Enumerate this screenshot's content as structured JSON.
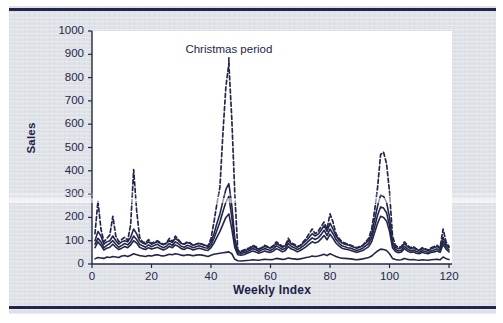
{
  "figure": {
    "background_color": "#dfe3e8",
    "plot_background_color": "#ffffff",
    "ink_color": "#23264b",
    "rule_color": "#22264a",
    "caption_top_text": "",
    "caption_bottom_text": ""
  },
  "chart_data": {
    "type": "line",
    "title": "",
    "subtitle": "",
    "xlabel": "Weekly Index",
    "ylabel": "Sales",
    "xlim": [
      0,
      121
    ],
    "ylim": [
      0,
      1000
    ],
    "xticks": [
      0,
      20,
      40,
      60,
      80,
      100,
      120
    ],
    "xtick_labels": [
      "0",
      "20",
      "40",
      "60",
      "80",
      "100",
      "120"
    ],
    "yticks": [
      0,
      100,
      200,
      300,
      400,
      500,
      600,
      700,
      800,
      900,
      1000
    ],
    "ytick_labels": [
      "0",
      "100",
      "200",
      "300",
      "400",
      "500",
      "600",
      "700",
      "800",
      "900",
      "1000"
    ],
    "grid": false,
    "legend_position": "none",
    "annotations": [
      {
        "text": "Christmas period",
        "x": 46,
        "y": 905,
        "pointer_to_x": 46,
        "pointer_to_y": 860
      }
    ],
    "series": [
      {
        "name": "Series A",
        "style": "dashed",
        "color": "#23264b",
        "x": [
          1,
          2,
          3,
          4,
          5,
          6,
          7,
          8,
          9,
          10,
          11,
          12,
          13,
          14,
          15,
          16,
          17,
          18,
          19,
          20,
          21,
          22,
          23,
          24,
          25,
          26,
          27,
          28,
          29,
          30,
          31,
          32,
          33,
          34,
          35,
          36,
          37,
          38,
          39,
          40,
          41,
          42,
          43,
          44,
          45,
          46,
          47,
          48,
          49,
          50,
          51,
          52,
          53,
          54,
          55,
          56,
          57,
          58,
          59,
          60,
          61,
          62,
          63,
          64,
          65,
          66,
          67,
          68,
          69,
          70,
          71,
          72,
          73,
          74,
          75,
          76,
          77,
          78,
          79,
          80,
          81,
          82,
          83,
          84,
          85,
          86,
          87,
          88,
          89,
          90,
          91,
          92,
          93,
          94,
          95,
          96,
          97,
          98,
          99,
          100,
          101,
          102,
          103,
          104,
          105,
          106,
          107,
          108,
          109,
          110,
          111,
          112,
          113,
          114,
          115,
          116,
          117,
          118,
          119,
          120
        ],
        "values": [
          130,
          270,
          150,
          95,
          110,
          125,
          205,
          120,
          95,
          105,
          115,
          100,
          170,
          405,
          230,
          115,
          95,
          90,
          105,
          88,
          95,
          100,
          92,
          85,
          90,
          110,
          95,
          120,
          105,
          90,
          85,
          95,
          90,
          80,
          85,
          90,
          85,
          80,
          75,
          110,
          180,
          260,
          330,
          560,
          760,
          860,
          620,
          300,
          60,
          55,
          60,
          65,
          70,
          80,
          75,
          65,
          70,
          80,
          75,
          70,
          80,
          95,
          85,
          75,
          80,
          110,
          90,
          85,
          75,
          80,
          95,
          110,
          130,
          150,
          130,
          140,
          160,
          180,
          150,
          215,
          180,
          130,
          110,
          95,
          90,
          85,
          80,
          75,
          70,
          75,
          80,
          95,
          110,
          150,
          230,
          330,
          470,
          480,
          430,
          310,
          120,
          80,
          70,
          75,
          95,
          80,
          70,
          75,
          65,
          60,
          70,
          65,
          60,
          70,
          75,
          80,
          70,
          150,
          95,
          75
        ]
      },
      {
        "name": "Series B",
        "style": "solid",
        "color": "#23264b",
        "x": [
          1,
          2,
          3,
          4,
          5,
          6,
          7,
          8,
          9,
          10,
          11,
          12,
          13,
          14,
          15,
          16,
          17,
          18,
          19,
          20,
          21,
          22,
          23,
          24,
          25,
          26,
          27,
          28,
          29,
          30,
          31,
          32,
          33,
          34,
          35,
          36,
          37,
          38,
          39,
          40,
          41,
          42,
          43,
          44,
          45,
          46,
          47,
          48,
          49,
          50,
          51,
          52,
          53,
          54,
          55,
          56,
          57,
          58,
          59,
          60,
          61,
          62,
          63,
          64,
          65,
          66,
          67,
          68,
          69,
          70,
          71,
          72,
          73,
          74,
          75,
          76,
          77,
          78,
          79,
          80,
          81,
          82,
          83,
          84,
          85,
          86,
          87,
          88,
          89,
          90,
          91,
          92,
          93,
          94,
          95,
          96,
          97,
          98,
          99,
          100,
          101,
          102,
          103,
          104,
          105,
          106,
          107,
          108,
          109,
          110,
          111,
          112,
          113,
          114,
          115,
          116,
          117,
          118,
          119,
          120
        ],
        "values": [
          100,
          140,
          120,
          85,
          95,
          100,
          120,
          100,
          85,
          95,
          100,
          95,
          115,
          150,
          130,
          100,
          90,
          85,
          95,
          85,
          90,
          95,
          88,
          82,
          88,
          100,
          92,
          110,
          100,
          88,
          85,
          92,
          88,
          80,
          85,
          88,
          85,
          80,
          78,
          95,
          130,
          175,
          215,
          270,
          320,
          345,
          250,
          110,
          55,
          50,
          55,
          60,
          65,
          75,
          70,
          62,
          68,
          75,
          72,
          68,
          75,
          88,
          80,
          72,
          78,
          100,
          85,
          80,
          72,
          78,
          90,
          100,
          115,
          130,
          120,
          128,
          145,
          165,
          140,
          175,
          150,
          120,
          102,
          90,
          85,
          82,
          78,
          72,
          68,
          72,
          78,
          90,
          100,
          130,
          190,
          250,
          295,
          290,
          265,
          200,
          95,
          72,
          65,
          70,
          88,
          75,
          66,
          70,
          62,
          58,
          66,
          62,
          58,
          66,
          70,
          75,
          66,
          115,
          85,
          70
        ]
      },
      {
        "name": "Series C",
        "style": "solid",
        "color": "#23264b",
        "x": [
          1,
          2,
          3,
          4,
          5,
          6,
          7,
          8,
          9,
          10,
          11,
          12,
          13,
          14,
          15,
          16,
          17,
          18,
          19,
          20,
          21,
          22,
          23,
          24,
          25,
          26,
          27,
          28,
          29,
          30,
          31,
          32,
          33,
          34,
          35,
          36,
          37,
          38,
          39,
          40,
          41,
          42,
          43,
          44,
          45,
          46,
          47,
          48,
          49,
          50,
          51,
          52,
          53,
          54,
          55,
          56,
          57,
          58,
          59,
          60,
          61,
          62,
          63,
          64,
          65,
          66,
          67,
          68,
          69,
          70,
          71,
          72,
          73,
          74,
          75,
          76,
          77,
          78,
          79,
          80,
          81,
          82,
          83,
          84,
          85,
          86,
          87,
          88,
          89,
          90,
          91,
          92,
          93,
          94,
          95,
          96,
          97,
          98,
          99,
          100,
          101,
          102,
          103,
          104,
          105,
          106,
          107,
          108,
          109,
          110,
          111,
          112,
          113,
          114,
          115,
          116,
          117,
          118,
          119,
          120
        ],
        "values": [
          85,
          110,
          95,
          70,
          80,
          88,
          100,
          85,
          72,
          80,
          88,
          82,
          95,
          120,
          105,
          85,
          78,
          72,
          82,
          74,
          80,
          85,
          76,
          70,
          76,
          88,
          80,
          95,
          88,
          76,
          72,
          80,
          76,
          70,
          74,
          78,
          74,
          70,
          68,
          82,
          110,
          145,
          180,
          225,
          265,
          290,
          200,
          88,
          48,
          44,
          48,
          52,
          58,
          66,
          62,
          54,
          60,
          66,
          62,
          58,
          66,
          78,
          70,
          62,
          68,
          88,
          75,
          70,
          62,
          68,
          78,
          88,
          100,
          112,
          105,
          112,
          126,
          145,
          122,
          150,
          130,
          105,
          90,
          78,
          74,
          70,
          68,
          62,
          58,
          62,
          68,
          78,
          88,
          112,
          160,
          210,
          245,
          240,
          220,
          165,
          82,
          62,
          56,
          60,
          76,
          65,
          57,
          60,
          54,
          50,
          57,
          54,
          50,
          57,
          60,
          65,
          57,
          98,
          74,
          60
        ]
      },
      {
        "name": "Series D",
        "style": "solid",
        "color": "#23264b",
        "x": [
          1,
          2,
          3,
          4,
          5,
          6,
          7,
          8,
          9,
          10,
          11,
          12,
          13,
          14,
          15,
          16,
          17,
          18,
          19,
          20,
          21,
          22,
          23,
          24,
          25,
          26,
          27,
          28,
          29,
          30,
          31,
          32,
          33,
          34,
          35,
          36,
          37,
          38,
          39,
          40,
          41,
          42,
          43,
          44,
          45,
          46,
          47,
          48,
          49,
          50,
          51,
          52,
          53,
          54,
          55,
          56,
          57,
          58,
          59,
          60,
          61,
          62,
          63,
          64,
          65,
          66,
          67,
          68,
          69,
          70,
          71,
          72,
          73,
          74,
          75,
          76,
          77,
          78,
          79,
          80,
          81,
          82,
          83,
          84,
          85,
          86,
          87,
          88,
          89,
          90,
          91,
          92,
          93,
          94,
          95,
          96,
          97,
          98,
          99,
          100,
          101,
          102,
          103,
          104,
          105,
          106,
          107,
          108,
          109,
          110,
          111,
          112,
          113,
          114,
          115,
          116,
          117,
          118,
          119,
          120
        ],
        "values": [
          70,
          95,
          80,
          60,
          68,
          72,
          85,
          72,
          62,
          68,
          75,
          70,
          82,
          100,
          90,
          72,
          66,
          62,
          70,
          64,
          68,
          72,
          65,
          60,
          66,
          76,
          70,
          82,
          76,
          66,
          62,
          70,
          66,
          60,
          64,
          68,
          64,
          60,
          58,
          70,
          90,
          115,
          140,
          170,
          200,
          215,
          150,
          70,
          40,
          38,
          40,
          45,
          50,
          56,
          52,
          46,
          50,
          56,
          52,
          50,
          56,
          66,
          60,
          52,
          58,
          75,
          64,
          60,
          52,
          58,
          66,
          75,
          85,
          95,
          90,
          95,
          108,
          122,
          104,
          128,
          110,
          90,
          78,
          68,
          64,
          62,
          58,
          54,
          50,
          54,
          58,
          66,
          75,
          95,
          135,
          175,
          205,
          200,
          185,
          140,
          70,
          54,
          48,
          52,
          66,
          56,
          50,
          52,
          46,
          44,
          50,
          46,
          44,
          50,
          52,
          56,
          50,
          84,
          64,
          52
        ]
      },
      {
        "name": "Series E",
        "style": "solid",
        "color": "#23264b",
        "x": [
          1,
          2,
          3,
          4,
          5,
          6,
          7,
          8,
          9,
          10,
          11,
          12,
          13,
          14,
          15,
          16,
          17,
          18,
          19,
          20,
          21,
          22,
          23,
          24,
          25,
          26,
          27,
          28,
          29,
          30,
          31,
          32,
          33,
          34,
          35,
          36,
          37,
          38,
          39,
          40,
          41,
          42,
          43,
          44,
          45,
          46,
          47,
          48,
          49,
          50,
          51,
          52,
          53,
          54,
          55,
          56,
          57,
          58,
          59,
          60,
          61,
          62,
          63,
          64,
          65,
          66,
          67,
          68,
          69,
          70,
          71,
          72,
          73,
          74,
          75,
          76,
          77,
          78,
          79,
          80,
          81,
          82,
          83,
          84,
          85,
          86,
          87,
          88,
          89,
          90,
          91,
          92,
          93,
          94,
          95,
          96,
          97,
          98,
          99,
          100,
          101,
          102,
          103,
          104,
          105,
          106,
          107,
          108,
          109,
          110,
          111,
          112,
          113,
          114,
          115,
          116,
          117,
          118,
          119,
          120
        ],
        "values": [
          22,
          28,
          26,
          24,
          30,
          28,
          32,
          30,
          28,
          34,
          36,
          32,
          38,
          44,
          40,
          36,
          34,
          32,
          36,
          34,
          38,
          40,
          36,
          34,
          38,
          42,
          40,
          44,
          42,
          38,
          36,
          40,
          38,
          35,
          38,
          40,
          38,
          35,
          32,
          38,
          42,
          44,
          46,
          48,
          50,
          52,
          44,
          20,
          14,
          13,
          14,
          15,
          16,
          18,
          17,
          16,
          18,
          20,
          19,
          18,
          20,
          24,
          22,
          20,
          21,
          26,
          23,
          22,
          20,
          22,
          25,
          28,
          30,
          34,
          32,
          34,
          38,
          42,
          36,
          44,
          38,
          32,
          28,
          25,
          24,
          23,
          22,
          20,
          18,
          20,
          22,
          25,
          28,
          34,
          46,
          56,
          64,
          62,
          58,
          44,
          24,
          19,
          17,
          18,
          24,
          20,
          18,
          19,
          17,
          16,
          18,
          17,
          16,
          18,
          19,
          20,
          18,
          30,
          23,
          19
        ]
      }
    ]
  }
}
